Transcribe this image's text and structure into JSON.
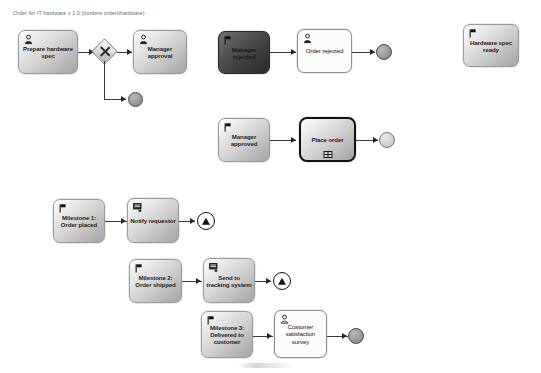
{
  "diagram": {
    "title": "Order for IT hardware v 1.0 (itorders orderithardware)",
    "type": "bpmn-process-diagram",
    "background_color": "#ffffff",
    "accent_color": "#3a3a3a"
  },
  "nodes": [
    {
      "id": "prepare-hardware-spec",
      "label": "Prepare hardware spec",
      "icon": "user-task-icon",
      "style": "gray",
      "shape": "rounded-task"
    },
    {
      "id": "gateway-exclusive",
      "label": "",
      "icon": "exclusive-gateway-icon",
      "style": "gray",
      "shape": "diamond"
    },
    {
      "id": "manager-approval",
      "label": "Manager approval",
      "icon": "user-task-icon",
      "style": "gray",
      "shape": "rounded-task"
    },
    {
      "id": "manager-rejected",
      "label": "Manager rejected",
      "icon": "start-event-flag-icon",
      "style": "dark",
      "shape": "rounded-task"
    },
    {
      "id": "order-rejected",
      "label": "Order rejected",
      "icon": "user-task-icon",
      "style": "white",
      "shape": "rounded-task"
    },
    {
      "id": "hardware-spec-ready",
      "label": "Hardware spec ready",
      "icon": "start-event-flag-icon",
      "style": "gray",
      "shape": "rounded-task"
    },
    {
      "id": "manager-approved",
      "label": "Manager approved",
      "icon": "start-event-flag-icon",
      "style": "gray",
      "shape": "rounded-task"
    },
    {
      "id": "place-order",
      "label": "Place order",
      "icon": "subprocess-marker-icon",
      "style": "gray-bold-border",
      "shape": "call-activity"
    },
    {
      "id": "milestone-1",
      "label": "Milestone 1: Order placed",
      "icon": "start-event-flag-icon",
      "style": "gray",
      "shape": "rounded-task"
    },
    {
      "id": "notify-requestor",
      "label": "Notify requestor",
      "icon": "script-task-icon",
      "style": "gray",
      "shape": "rounded-task"
    },
    {
      "id": "milestone-2",
      "label": "Milestone 2: Order shipped",
      "icon": "start-event-flag-icon",
      "style": "gray",
      "shape": "rounded-task"
    },
    {
      "id": "send-to-tracking-system",
      "label": "Send to tracking system",
      "icon": "script-task-icon",
      "style": "gray",
      "shape": "rounded-task"
    },
    {
      "id": "milestone-3",
      "label": "Milestone 3: Delivered to customer",
      "icon": "start-event-flag-icon",
      "style": "gray",
      "shape": "rounded-task"
    },
    {
      "id": "customer-satisfaction-survey",
      "label": "Customer satisfaction survey",
      "icon": "user-task-icon",
      "style": "white",
      "shape": "rounded-task"
    }
  ],
  "events": [
    {
      "id": "end-event-gateway-branch",
      "kind": "end-event",
      "style": "gray"
    },
    {
      "id": "end-event-order-rejected",
      "kind": "end-event",
      "style": "gray"
    },
    {
      "id": "end-event-place-order",
      "kind": "end-event",
      "style": "light-gray"
    },
    {
      "id": "end-event-notify-requestor",
      "kind": "escalation-end-event",
      "style": "white-triangle"
    },
    {
      "id": "end-event-send-to-tracking",
      "kind": "escalation-end-event",
      "style": "white-triangle"
    },
    {
      "id": "end-event-survey",
      "kind": "end-event",
      "style": "gray"
    }
  ],
  "labels": {
    "node_1": "Prepare hardware spec",
    "node_2": "Manager approval",
    "node_3": "Manager rejected",
    "node_4": "Order rejected",
    "node_5": "Hardware spec ready",
    "node_6": "Manager approved",
    "node_7": "Place order",
    "node_8": "Milestone 1: Order placed",
    "node_9": "Notify requestor",
    "node_10": "Milestone 2: Order shipped",
    "node_11": "Send to tracking system",
    "node_12": "Milestone 3: Delivered to customer",
    "node_13": "Customer satisfaction survey"
  }
}
